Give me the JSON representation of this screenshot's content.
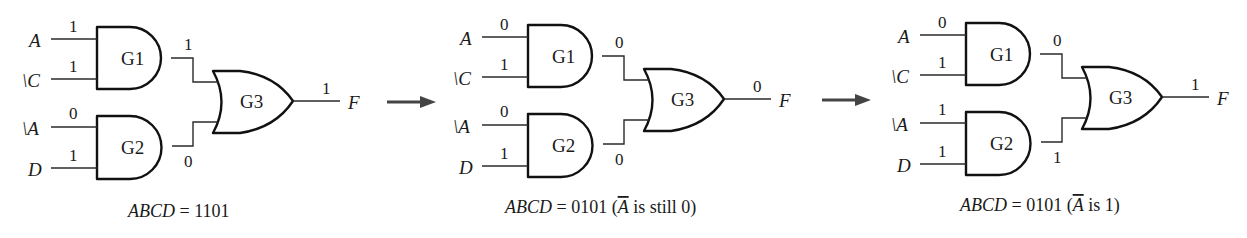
{
  "panels": [
    {
      "inputs": {
        "A": "1",
        "notC": "1",
        "notA": "0",
        "D": "1"
      },
      "outputs": {
        "G1": "1",
        "G2": "0",
        "F": "1"
      },
      "caption": {
        "prefix": "ABCD",
        "eq": " = 1101",
        "note": "",
        "overbar_var": "",
        "note_suffix": ""
      }
    },
    {
      "inputs": {
        "A": "0",
        "notC": "1",
        "notA": "0",
        "D": "1"
      },
      "outputs": {
        "G1": "0",
        "G2": "0",
        "F": "0"
      },
      "caption": {
        "prefix": "ABCD",
        "eq": " = 0101 (",
        "overbar_var": "A",
        "note_suffix": " is still 0)"
      }
    },
    {
      "inputs": {
        "A": "0",
        "notC": "1",
        "notA": "1",
        "D": "1"
      },
      "outputs": {
        "G1": "0",
        "G2": "1",
        "F": "1"
      },
      "caption": {
        "prefix": "ABCD",
        "eq": " = 0101 (",
        "overbar_var": "A",
        "note_suffix": " is 1)"
      }
    }
  ],
  "labels": {
    "input_A": "A",
    "input_notC": "\\C",
    "input_notA": "\\A",
    "input_D": "D",
    "output_F": "F",
    "gate1": "G1",
    "gate2": "G2",
    "gate3": "G3"
  },
  "arrows": [
    {
      "from_panel": 1,
      "to_panel": 2,
      "icon": "right-arrow-icon"
    },
    {
      "from_panel": 2,
      "to_panel": 3,
      "icon": "right-arrow-icon"
    }
  ]
}
